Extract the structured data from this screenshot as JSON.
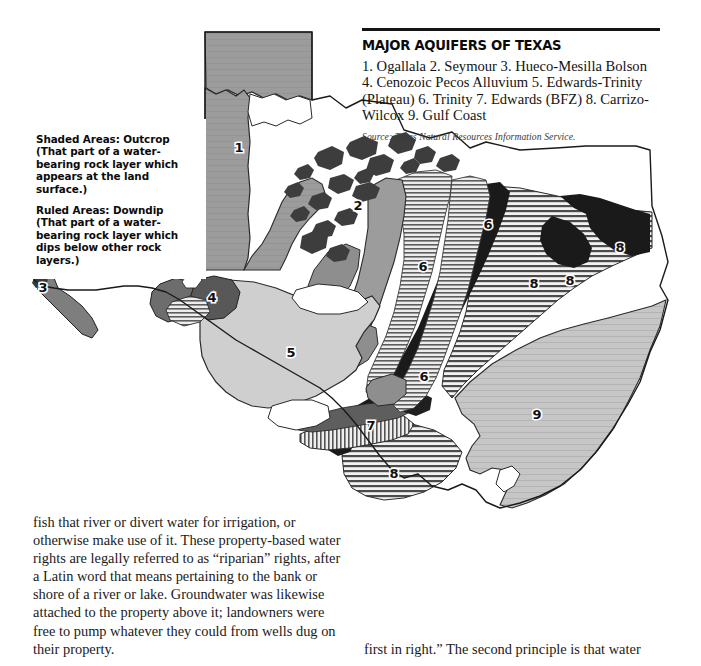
{
  "figure": {
    "name": "major-aquifers-of-texas-map",
    "title": "MAJOR AQUIFERS OF TEXAS",
    "aquifer_list": "1. Ogallala  2. Seymour  3. Hueco-Mesilla Bolson 4. Cenozoic Pecos Alluvium  5. Edwards-Trinity (Plateau)  6. Trinity  7. Edwards (BFZ)  8. Carrizo-Wilcox  9. Gulf Coast",
    "source": "Source: Texas Natural Resources Information Service.",
    "legend": {
      "shaded": "Shaded Areas: Outcrop (That part of a water-bearing rock layer which appears at the land surface.)",
      "ruled": "Ruled Areas: Downdip (That part of a water-bearing rock layer which dips below other rock layers.)"
    },
    "aquifers": [
      {
        "number": "1",
        "name": "Ogallala",
        "label_x": 239,
        "label_y": 152
      },
      {
        "number": "2",
        "name": "Seymour",
        "label_x": 358,
        "label_y": 210
      },
      {
        "number": "3",
        "name": "Hueco-Mesilla Bolson",
        "label_x": 43,
        "label_y": 292
      },
      {
        "number": "4",
        "name": "Cenozoic Pecos Alluvium",
        "label_x": 212,
        "label_y": 302
      },
      {
        "number": "5",
        "name": "Edwards-Trinity (Plateau)",
        "label_x": 291,
        "label_y": 357
      },
      {
        "number": "6",
        "name": "Trinity",
        "label_x": 488,
        "label_y": 229
      },
      {
        "number": "6",
        "name": "Trinity",
        "label_x": 423,
        "label_y": 271
      },
      {
        "number": "6",
        "name": "Trinity",
        "label_x": 424,
        "label_y": 381
      },
      {
        "number": "7",
        "name": "Edwards (BFZ)",
        "label_x": 371,
        "label_y": 430
      },
      {
        "number": "8",
        "name": "Carrizo-Wilcox",
        "label_x": 534,
        "label_y": 288
      },
      {
        "number": "8",
        "name": "Carrizo-Wilcox",
        "label_x": 570,
        "label_y": 285
      },
      {
        "number": "8",
        "name": "Carrizo-Wilcox",
        "label_x": 620,
        "label_y": 252
      },
      {
        "number": "8",
        "name": "Carrizo-Wilcox",
        "label_x": 394,
        "label_y": 478
      },
      {
        "number": "9",
        "name": "Gulf Coast",
        "label_x": 537,
        "label_y": 419
      }
    ],
    "colors": {
      "outcrop_mid_gray": "#9a9a9a",
      "outcrop_dark_gray": "#6e6e6e",
      "outcrop_black": "#1c1c1c",
      "downdip_light": "#d8d8d8",
      "gulf_coast": "#c3c3c3",
      "rule_line": "#141414",
      "outline": "#1a1a1a",
      "page_background": "#ffffff"
    }
  },
  "body_text": {
    "left_column": "fish that river or divert water for irrigation, or otherwise make use of it. These property-based water rights are legally referred to as “riparian” rights, after a Latin word that means pertaining to the bank or shore of a river or lake. Groundwater was likewise attached to the property above it; landowners were free to pump whatever they could from wells dug on their property.",
    "right_column": "first in right.” The second principle is that water"
  }
}
